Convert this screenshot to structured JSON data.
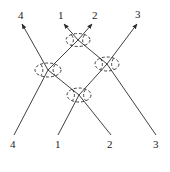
{
  "diagram": {
    "type": "factorized-scattering",
    "colors": {
      "stroke": "#2a2a2a",
      "text": "#1a1a1a",
      "background": "#ffffff"
    },
    "vertices": [
      {
        "id": "top",
        "cx": 78,
        "cy": 40,
        "rx": 12,
        "ry": 6.5
      },
      {
        "id": "left",
        "cx": 48,
        "cy": 70,
        "rx": 13,
        "ry": 7
      },
      {
        "id": "right",
        "cx": 107,
        "cy": 64,
        "rx": 12,
        "ry": 7
      },
      {
        "id": "bottom",
        "cx": 79,
        "cy": 95,
        "rx": 12,
        "ry": 7
      }
    ],
    "lines": [
      {
        "id": "4",
        "points": "14,135 48,70 22,24"
      },
      {
        "id": "1",
        "points": "58,135 79,95 48,70 78,40 64,24"
      },
      {
        "id": "2",
        "points": "111,135 79,95 107,64 78,40 92,24"
      },
      {
        "id": "3",
        "points": "156,135 107,64 137,24"
      }
    ],
    "top_labels": [
      {
        "text": "4",
        "x": 18,
        "y": 19
      },
      {
        "text": "1",
        "x": 58,
        "y": 19
      },
      {
        "text": "2",
        "x": 92,
        "y": 19
      },
      {
        "text": "3",
        "x": 135,
        "y": 18
      }
    ],
    "bottom_labels": [
      {
        "text": "4",
        "x": 10,
        "y": 148
      },
      {
        "text": "1",
        "x": 55,
        "y": 148
      },
      {
        "text": "2",
        "x": 107,
        "y": 148
      },
      {
        "text": "3",
        "x": 153,
        "y": 148
      }
    ]
  }
}
